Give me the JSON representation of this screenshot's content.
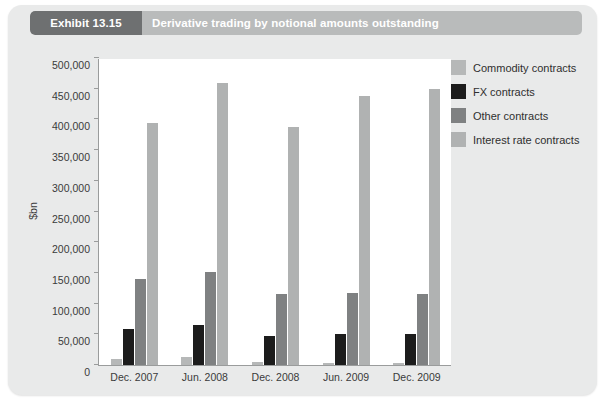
{
  "header": {
    "badge": "Exhibit 13.15",
    "title": "Derivative trading by notional amounts outstanding"
  },
  "colors": {
    "commodity": "#b6b8b8",
    "fx": "#1c1c1c",
    "other": "#7f8182",
    "interest_rate": "#b0b2b2",
    "card_bg": "#e9eaea",
    "badge_bg": "#6e7071",
    "banner_bg": "#b9bbbb",
    "axis": "#9a9c9c",
    "plot_bg": "#ffffff"
  },
  "legend": {
    "position": "right",
    "items": [
      {
        "label": "Commodity contracts",
        "color": "#b6b8b8",
        "swatch": "legend-swatch-commodity"
      },
      {
        "label": "FX contracts",
        "color": "#1c1c1c",
        "swatch": "legend-swatch-fx"
      },
      {
        "label": "Other contracts",
        "color": "#7f8182",
        "swatch": "legend-swatch-other"
      },
      {
        "label": "Interest rate contracts",
        "color": "#b0b2b2",
        "swatch": "legend-swatch-interest-rate"
      }
    ]
  },
  "chart_data": {
    "type": "bar",
    "title": "Derivative trading by notional amounts outstanding",
    "xlabel": "",
    "ylabel": "$bn",
    "ylim": [
      0,
      500000
    ],
    "ytick_step": 50000,
    "grid": false,
    "legend_position": "right",
    "categories": [
      "Dec. 2007",
      "Jun. 2008",
      "Dec. 2008",
      "Jun. 2009",
      "Dec. 2009"
    ],
    "ytick_labels": [
      "0",
      "50,000",
      "100,000",
      "150,000",
      "200,000",
      "250,000",
      "300,000",
      "350,000",
      "400,000",
      "450,000",
      "500,000"
    ],
    "series": [
      {
        "name": "Commodity contracts",
        "color": "#b6b8b8",
        "values": [
          9000,
          13000,
          4500,
          4000,
          3000
        ]
      },
      {
        "name": "FX contracts",
        "color": "#1c1c1c",
        "values": [
          58000,
          65000,
          47000,
          50000,
          50000
        ]
      },
      {
        "name": "Other contracts",
        "color": "#7f8182",
        "values": [
          140000,
          152000,
          115000,
          117000,
          115000
        ]
      },
      {
        "name": "Interest rate contracts",
        "color": "#b0b2b2",
        "values": [
          394000,
          459000,
          387000,
          438000,
          450000
        ]
      }
    ]
  }
}
